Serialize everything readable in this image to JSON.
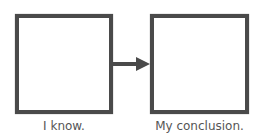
{
  "diagram": {
    "type": "flow",
    "nodes": [
      {
        "id": "box1",
        "label": "I know.",
        "content": ""
      },
      {
        "id": "box2",
        "label": "My conclusion.",
        "content": ""
      }
    ],
    "edges": [
      {
        "from": "box1",
        "to": "box2",
        "style": "arrow"
      }
    ],
    "colors": {
      "border": "#4a4a4a",
      "arrow": "#4a4a4a",
      "label": "#555555"
    }
  }
}
